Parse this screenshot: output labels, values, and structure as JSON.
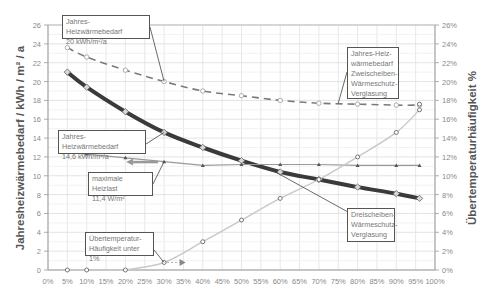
{
  "chart_data": {
    "type": "line",
    "title": "",
    "xlabel": "",
    "ylabel": "Jahresheizwärmebedarf / kWh / m² / a",
    "y2label": "Übertemperaturhäufigkeit %",
    "x_ticks": [
      "0%",
      "5%",
      "10%",
      "15%",
      "20%",
      "25%",
      "30%",
      "35%",
      "40%",
      "45%",
      "50%",
      "55%",
      "60%",
      "65%",
      "70%",
      "75%",
      "80%",
      "85%",
      "90%",
      "95%",
      "100%"
    ],
    "y_ticks": [
      "0",
      "2",
      "4",
      "6",
      "8",
      "10",
      "12",
      "14",
      "16",
      "18",
      "20",
      "22",
      "24",
      "26"
    ],
    "y2_ticks": [
      "0%",
      "2%",
      "4%",
      "6%",
      "8%",
      "10%",
      "12%",
      "14%",
      "16%",
      "18%",
      "20%",
      "22%",
      "24%",
      "26%"
    ],
    "xlim": [
      0,
      100
    ],
    "ylim": [
      0,
      26
    ],
    "y2lim": [
      0,
      26
    ],
    "grid": true,
    "x": [
      5,
      10,
      20,
      30,
      40,
      50,
      60,
      70,
      80,
      90,
      96
    ],
    "series": [
      {
        "name": "Jahres-Heizwärmebedarf Zweischeiben-Wärmeschutz-Verglasung",
        "axis": "left",
        "style": "dashed",
        "color": "#7a7a7a",
        "values": [
          23.6,
          22.6,
          21.2,
          20.0,
          19.0,
          18.5,
          18.0,
          17.7,
          17.6,
          17.5,
          17.5
        ]
      },
      {
        "name": "Dreischeiben-Wärmeschutz-Verglasung",
        "axis": "left",
        "style": "thick",
        "color": "#3a3a3a",
        "values": [
          21.0,
          19.4,
          16.8,
          14.6,
          13.0,
          11.6,
          10.4,
          9.6,
          8.8,
          8.1,
          7.6
        ]
      },
      {
        "name": "maximale Heizlast",
        "axis": "left",
        "style": "thin-triangles",
        "color": "#8a8a8a",
        "values": [
          12.5,
          12.3,
          11.9,
          11.5,
          11.1,
          11.2,
          11.2,
          11.2,
          11.1,
          11.1,
          11.1
        ]
      },
      {
        "name": "Übertemperatur-Häufigkeit",
        "axis": "right",
        "style": "light-circles",
        "color": "#c8c8c8",
        "values": [
          0,
          0,
          0,
          0.8,
          3.0,
          5.3,
          7.6,
          9.6,
          12.0,
          14.6,
          17.0
        ]
      }
    ],
    "annotations": [
      {
        "id": "a1",
        "lines": [
          "Jahres-Heizwärmebedarf",
          "20 kWh/m²/a"
        ]
      },
      {
        "id": "a2",
        "lines": [
          "Jahres-Heiz-",
          "wärmebedarf",
          "Zweischeiben-",
          "Wärmeschutz-",
          "Verglasung"
        ]
      },
      {
        "id": "a3",
        "lines": [
          "Jahres-Heizwärmebedarf",
          "14,6 kWh/m²/a"
        ]
      },
      {
        "id": "a4",
        "lines": [
          "maximale Heizlast",
          "11,4 W/m²"
        ]
      },
      {
        "id": "a5",
        "lines": [
          "Dreischeiben-",
          "Wärmeschutz-",
          "Verglasung"
        ]
      },
      {
        "id": "a6",
        "lines": [
          "Übertemperatur-",
          "Häufigkeit unter 1%"
        ]
      }
    ]
  }
}
